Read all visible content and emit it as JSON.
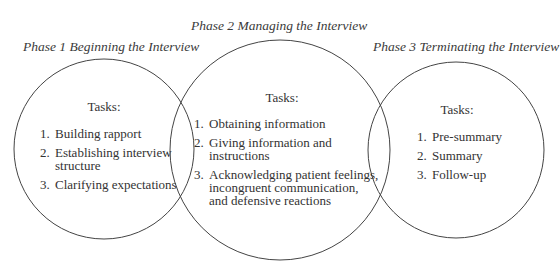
{
  "diagram": {
    "type": "overlapping-circles",
    "phases": [
      {
        "title": "Phase 1 Beginning the Interview",
        "tasks_heading": "Tasks:",
        "circle": {
          "cx": 104,
          "cy": 149,
          "r": 90
        },
        "tasks": [
          {
            "num": "1.",
            "text": "Building rapport"
          },
          {
            "num": "2.",
            "text": "Establishing interview\nstructure"
          },
          {
            "num": "3.",
            "text": "Clarifying expectations"
          }
        ]
      },
      {
        "title": "Phase 2 Managing the Interview",
        "tasks_heading": "Tasks:",
        "circle": {
          "cx": 280,
          "cy": 150,
          "r": 110
        },
        "tasks": [
          {
            "num": "1.",
            "text": "Obtaining information"
          },
          {
            "num": "2.",
            "text": "Giving information and\ninstructions"
          },
          {
            "num": "3.",
            "text": "Acknowledging patient feelings,\nincongruent communication,\nand defensive reactions"
          }
        ]
      },
      {
        "title": "Phase 3 Terminating the Interview",
        "tasks_heading": "Tasks:",
        "circle": {
          "cx": 456,
          "cy": 150,
          "r": 88
        },
        "tasks": [
          {
            "num": "1.",
            "text": "Pre-summary"
          },
          {
            "num": "2.",
            "text": "Summary"
          },
          {
            "num": "3.",
            "text": "Follow-up"
          }
        ]
      }
    ],
    "colors": {
      "stroke": "#444444",
      "text": "#333333",
      "background": "#ffffff"
    }
  }
}
